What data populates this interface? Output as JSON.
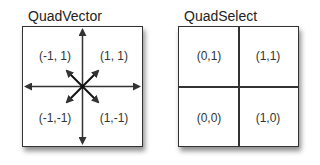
{
  "quad_vector": {
    "title": "QuadVector",
    "labels": {
      "top_left": "(-1, 1)",
      "top_right": "(1, 1)",
      "bottom_left": "(-1,-1)",
      "bottom_right": "(1,-1)"
    }
  },
  "quad_select": {
    "title": "QuadSelect",
    "labels": {
      "top_left": "(0,1)",
      "top_right": "(1,1)",
      "bottom_left": "(0,0)",
      "bottom_right": "(1,0)"
    }
  }
}
